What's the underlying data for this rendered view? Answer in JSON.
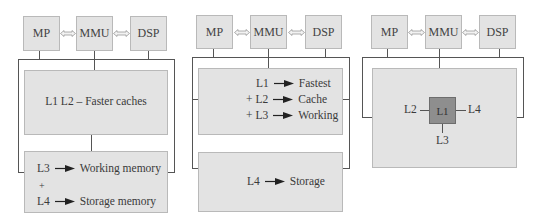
{
  "panels": [
    {
      "id": "panel-1",
      "top_boxes": [
        "MP",
        "MMU",
        "DSP"
      ],
      "upper_box": {
        "text": "L1 L2 – Faster caches"
      },
      "lower_box": {
        "rows": [
          {
            "level": "L3",
            "desc": "Working memory"
          },
          {
            "plus": "+"
          },
          {
            "level": "L4",
            "desc": "Storage memory"
          }
        ]
      }
    },
    {
      "id": "panel-2",
      "top_boxes": [
        "MP",
        "MMU",
        "DSP"
      ],
      "upper_box": {
        "rows": [
          {
            "prefix": "",
            "level": "L1",
            "desc": "Fastest"
          },
          {
            "prefix": "+",
            "level": "L2",
            "desc": "Cache"
          },
          {
            "prefix": "+",
            "level": "L3",
            "desc": "Working"
          }
        ]
      },
      "lower_box": {
        "rows": [
          {
            "level": "L4",
            "desc": "Storage"
          }
        ]
      }
    },
    {
      "id": "panel-3",
      "top_boxes": [
        "MP",
        "MMU",
        "DSP"
      ],
      "center": {
        "label": "L1",
        "left": "L2",
        "right": "L4",
        "bottom": "L3"
      }
    }
  ],
  "colors": {
    "box_fill": "#e3e3e3",
    "box_border": "#b9b9b9",
    "line": "#555555",
    "l1_fill": "#8e8e8e",
    "text": "#3a3a3a"
  }
}
